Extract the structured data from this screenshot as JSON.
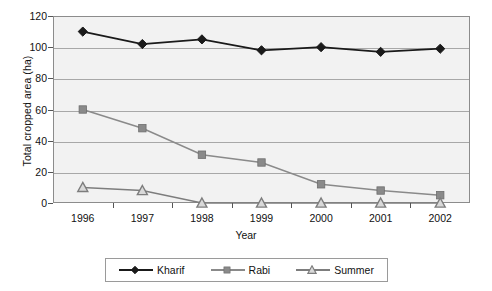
{
  "chart_data": {
    "type": "line",
    "title": "",
    "xlabel": "Year",
    "ylabel": "Total cropped area (ha)",
    "categories": [
      "1996",
      "1997",
      "1998",
      "1999",
      "2000",
      "2001",
      "2002"
    ],
    "ylim": [
      0,
      120
    ],
    "yticks": [
      0,
      20,
      40,
      60,
      80,
      100,
      120
    ],
    "ytick_labels": [
      "0",
      "20",
      "40",
      "60",
      "80",
      "100",
      "120"
    ],
    "grid": "horizontal",
    "legend_position": "bottom",
    "series": [
      {
        "name": "Kharif",
        "marker": "diamond",
        "color": "#1a1a1a",
        "values": [
          110,
          102,
          105,
          98,
          100,
          97,
          99
        ]
      },
      {
        "name": "Rabi",
        "marker": "square",
        "color": "#8a8a8a",
        "values": [
          60,
          48,
          31,
          26,
          12,
          8,
          5
        ]
      },
      {
        "name": "Summer",
        "marker": "triangle",
        "color": "#7d7d7d",
        "values": [
          10,
          8,
          0,
          0,
          0,
          0,
          0
        ]
      }
    ]
  },
  "legend": {
    "entries": [
      {
        "label": "Kharif"
      },
      {
        "label": "Rabi"
      },
      {
        "label": "Summer"
      }
    ]
  },
  "colors": {
    "plot_background": "#f2f2f2",
    "gridline": "#a8a8a8",
    "frame": "#8c8c8c",
    "kharif": "#1a1a1a",
    "rabi": "#8a8a8a",
    "summer": "#7d7d7d"
  }
}
